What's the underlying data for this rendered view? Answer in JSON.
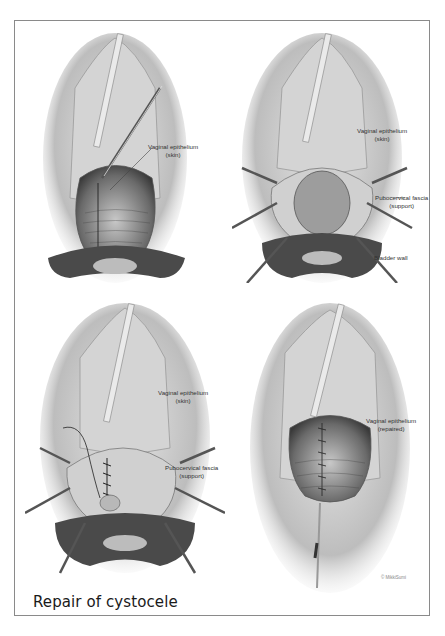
{
  "figure": {
    "caption": "Repair of cystocele",
    "copyright": "© MikkiSumi",
    "colors": {
      "frame": "#8a8a8a",
      "ink": "#333333",
      "tissue_dark": "#3a3a3a",
      "tissue_light": "#d8d8d8"
    }
  },
  "panels": [
    {
      "id": "panel-1",
      "position": "top-left",
      "labels": [
        {
          "line1": "Vaginal epithelium",
          "line2": "(skin)"
        }
      ]
    },
    {
      "id": "panel-2",
      "position": "top-right",
      "labels": [
        {
          "line1": "Vaginal epithelium",
          "line2": "(skin)"
        },
        {
          "line1": "Pubocervical fascia",
          "line2": "(support)"
        },
        {
          "line1": "Bladder wall",
          "line2": ""
        }
      ]
    },
    {
      "id": "panel-3",
      "position": "bottom-left",
      "labels": [
        {
          "line1": "Vaginal epithelium",
          "line2": "(skin)"
        },
        {
          "line1": "Pubocervical fascia",
          "line2": "(support)"
        }
      ]
    },
    {
      "id": "panel-4",
      "position": "bottom-right",
      "labels": [
        {
          "line1": "Vaginal epithelium",
          "line2": "(repaired)"
        }
      ]
    }
  ]
}
